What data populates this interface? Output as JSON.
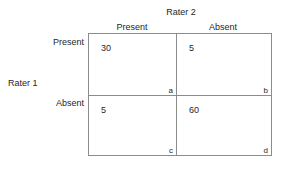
{
  "figure": {
    "column_axis_title": "Rater 2",
    "row_axis_title": "Rater 1",
    "column_headers": [
      "Present",
      "Absent"
    ],
    "row_headers": [
      "Present",
      "Absent"
    ],
    "border_color": "#8c8c8c",
    "text_color": "#262626",
    "background_color": "#ffffff"
  },
  "chart_data": {
    "type": "table",
    "title": "",
    "xlabel": "Rater 2",
    "ylabel": "Rater 1",
    "columns": [
      "Present",
      "Absent"
    ],
    "rows": [
      "Present",
      "Absent"
    ],
    "values": [
      [
        30,
        5
      ],
      [
        5,
        60
      ]
    ],
    "cells": [
      {
        "row": "Present",
        "column": "Present",
        "value": "30",
        "key": "a"
      },
      {
        "row": "Present",
        "column": "Absent",
        "value": "5",
        "key": "b"
      },
      {
        "row": "Absent",
        "column": "Present",
        "value": "5",
        "key": "c"
      },
      {
        "row": "Absent",
        "column": "Absent",
        "value": "60",
        "key": "d"
      }
    ],
    "legend": [],
    "annotations": [
      "a",
      "b",
      "c",
      "d"
    ],
    "grid": true
  }
}
